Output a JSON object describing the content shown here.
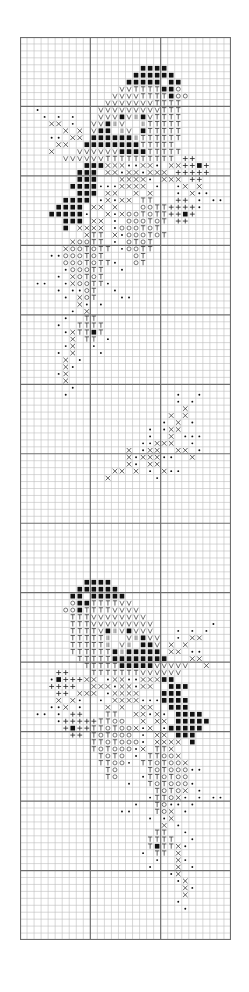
{
  "chart": {
    "title": "",
    "columns": 30,
    "rows": 130,
    "major_every": 10,
    "major_row_offset": 10,
    "colors": {
      "minor_line": "#bdbdbd",
      "major_line": "#6e6e6e",
      "border": "#6e6e6e",
      "symbol": "#222222",
      "background": "#ffffff"
    },
    "legend": {
      "B": "black-square",
      "V": "V",
      "T": "T",
      "O": "O",
      "X": "X",
      "+": "+",
      "d": "dot",
      "I": "double-bar"
    },
    "pattern_rows": [
      {
        "r": 4,
        "s": ".................BBBB........."
      },
      {
        "r": 5,
        "s": "................BBBBBB........"
      },
      {
        "r": 6,
        "s": "...............BBBBB.BB......."
      },
      {
        "r": 7,
        "s": "..............VVTTTTBBO......."
      },
      {
        "r": 8,
        "s": ".............VVVVTTTTBOO......"
      },
      {
        "r": 9,
        "s": "............VVVVVVVTTTT......."
      },
      {
        "r": 10,
        "s": "..d........VVVVVVVVVTTT......."
      },
      {
        "r": 11,
        "s": "...d.d.d...VVVBVIBVTTTT......."
      },
      {
        "r": 12,
        "s": "....XX.d..VVBIV..ITTTTT......."
      },
      {
        "r": 13,
        "s": "......X.X.VBB.IV.BTTTTT......."
      },
      {
        "r": 14,
        "s": "....dd.XX.BBBBBBITTTTTT......."
      },
      {
        "r": 15,
        "s": ".....XX..BBBBBBBBTTTTT........"
      },
      {
        "r": 16,
        "s": "....X...VVVVVVBBBBTTTTT......."
      },
      {
        "r": 17,
        "s": "......VVVVVVTTTTTTTTTT.++....."
      },
      {
        "r": 18,
        "s": ".........BBBXXXddXXd.XX++B+..."
      },
      {
        "r": 19,
        "s": "........BBB.XXdXXdXXX.+++++..."
      },
      {
        "r": 20,
        "s": "........BBB...XXXXd.XXX.++...."
      },
      {
        "r": 21,
        "s": ".......BBBBdddXXXX.d..dX.X...."
      },
      {
        "r": 22,
        "s": "........BBB.XX..X.X...d.Xdd..."
      },
      {
        "r": 23,
        "s": "......BBBB.dXdXX.TT...++.d.dd."
      },
      {
        "r": 24,
        "s": ".....BBBB.XX.X...OOTT++++d...."
      },
      {
        "r": 25,
        "s": "....BBBBBd..XdXOOTOTT++B+....."
      },
      {
        "r": 26,
        "s": "......BBB.XX.d.OOOTOT.++......"
      },
      {
        "r": 27,
        "s": "......B.XXXX.dOOOTOT.........."
      },
      {
        "r": 28,
        "s": ".........XTT.XdOOOTOT........."
      },
      {
        "r": 29,
        "s": ".......XOOTT.d.OTOT..........."
      },
      {
        "r": 30,
        "s": "......XOOTOTT.dOOTT..........."
      },
      {
        "r": 31,
        "s": "....ddOOOTOT....OT............"
      },
      {
        "r": 32,
        "s": "......OOOTOTTd..OT............"
      },
      {
        "r": 33,
        "s": "......dOOOTT..d..............."
      },
      {
        "r": 34,
        "s": ".....d.XOTOT.................."
      },
      {
        "r": 35,
        "s": "..dd..dXOOTTd................."
      },
      {
        "r": 36,
        "s": ".....d.ddOT..d................"
      },
      {
        "r": 37,
        "s": "......d.XOT...dd.............."
      },
      {
        "r": 38,
        "s": "........Xd.d.................."
      },
      {
        "r": 39,
        "s": ".......d.X...................."
      },
      {
        "r": 40,
        "s": "......d..TT..................."
      },
      {
        "r": 41,
        "s": ".....d..TTTT.................."
      },
      {
        "r": 42,
        "s": "......dXTTBT.................."
      },
      {
        "r": 43,
        "s": ".......X.TT.d................."
      },
      {
        "r": 44,
        "s": "......dX..d..................."
      },
      {
        "r": 45,
        "s": ".....d.X...d.................."
      },
      {
        "r": 46,
        "s": "......X.d....................."
      },
      {
        "r": 47,
        "s": "......Xd......................"
      },
      {
        "r": 48,
        "s": ".....dX......................."
      },
      {
        "r": 49,
        "s": "......X......................."
      },
      {
        "r": 50,
        "s": ".......d......................"
      },
      {
        "r": 51,
        "s": "......d...............d..d...."
      },
      {
        "r": 52,
        "s": "......................d.d....."
      },
      {
        "r": 53,
        "s": ".......................X......"
      },
      {
        "r": 54,
        "s": ".....................X.X......"
      },
      {
        "r": 55,
        "s": "....................d.X.d....."
      },
      {
        "r": 56,
        "s": "..................d.dXX......."
      },
      {
        "r": 57,
        "s": "..................d..X.ddd...."
      },
      {
        "r": 58,
        "s": ".................ddXXX..d....."
      },
      {
        "r": 59,
        "s": "...............X.dXX..XX.d...."
      },
      {
        "r": 60,
        "s": "...............XdXXXdd..X....."
      },
      {
        "r": 61,
        "s": "...............Xd.XX.........."
      },
      {
        "r": 62,
        "s": ".............XX.X.d.Xdd......."
      },
      {
        "r": 63,
        "s": "............X......d.........."
      },
      {
        "r": 78,
        "s": ".........BBBB................."
      },
      {
        "r": 79,
        "s": "........BBBBBB................"
      },
      {
        "r": 80,
        "s": ".......BB.BBBBB..............."
      },
      {
        "r": 81,
        "s": ".......OBBTTTTVV.............."
      },
      {
        "r": 82,
        "s": "......OOBTTTTVVVV............."
      },
      {
        "r": 83,
        "s": ".......TTTVVVVVVVV............"
      },
      {
        "r": 84,
        "s": ".......TTTVVVVVVVVV........d.."
      },
      {
        "r": 85,
        "s": ".......TTTTVBIVBVVV...d.d.d..."
      },
      {
        "r": 86,
        "s": ".......TTTTTI..VIBVV..d.XX...."
      },
      {
        "r": 87,
        "s": ".......TTTTTI.VI.BBV.X.X......"
      },
      {
        "r": 88,
        "s": ".......TTTTTTBIBBBBB.XX.dd...."
      },
      {
        "r": 89,
        "s": "........TTTTTBBBBBBBB...XX...."
      },
      {
        "r": 90,
        "s": ".........TTTTTBBBBBVVVVV..X..."
      },
      {
        "r": 91,
        "s": ".....++...TTTTTTTVVVVVV......."
      },
      {
        "r": 92,
        "s": "....dB+++XX.dXXddXXXBB........"
      },
      {
        "r": 93,
        "s": "....++++..XXXdXXdXX..BBB......"
      },
      {
        "r": 94,
        "s": ".....++.XXX.dXXXX...BBB......."
      },
      {
        "r": 95,
        "s": ".....X.Xd..d.XXXXdddBBBB......"
      },
      {
        "r": 96,
        "s": "....ddX.d...X.X..XX..BBB......"
      },
      {
        "r": 97,
        "s": "..dd.d.++...TT..XXdXd.BBBB...."
      },
      {
        "r": 98,
        "s": ".....d+++++TTOO..X.XX.BBBBB..."
      },
      {
        "r": 99,
        "s": "......+B++TTOTOOXdX.dBBBBB...."
      },
      {
        "r": 100,
        "s": ".......++.TOTOOO.d.XX.BBB....."
      },
      {
        "r": 101,
        "s": "..........TTOTOOOd.XXXX.B....."
      },
      {
        "r": 102,
        "s": "..........TOTOOOdX.TTX........"
      },
      {
        "r": 103,
        "s": "...........TOTO.d.TTOOX......."
      },
      {
        "r": 104,
        "s": "...........TTOOd.TTOTOOX......"
      },
      {
        "r": 105,
        "s": "............TO....TOTOOOdd...."
      },
      {
        "r": 106,
        "s": "............TO...dTTOTOO......"
      },
      {
        "r": 107,
        "s": "...............d..TOTOOOd....."
      },
      {
        "r": 108,
        "s": "...................TOTOX.d...."
      },
      {
        "r": 109,
        "s": "..................dTTOXd.d.dd."
      },
      {
        "r": 110,
        "s": "................d..TOdd.d....."
      },
      {
        "r": 111,
        "s": "..............dd...TOX.d......"
      },
      {
        "r": 112,
        "s": "..................d.dX........"
      },
      {
        "r": 113,
        "s": "....................X.d......."
      },
      {
        "r": 114,
        "s": "...................TT..d......"
      },
      {
        "r": 115,
        "s": "..................TTTT..d....."
      },
      {
        "r": 116,
        "s": "..................TBTTXd......"
      },
      {
        "r": 117,
        "s": ".................d.TT.X......."
      },
      {
        "r": 118,
        "s": "...................d..Xd......"
      },
      {
        "r": 119,
        "s": "..................d...X.d....."
      },
      {
        "r": 120,
        "s": ".....................dX......."
      },
      {
        "r": 121,
        "s": "......................dX......"
      },
      {
        "r": 122,
        "s": ".......................Xd....."
      },
      {
        "r": 123,
        "s": ".......................X......"
      },
      {
        "r": 124,
        "s": "......................d......."
      },
      {
        "r": 125,
        "s": ".......................d......"
      }
    ]
  }
}
